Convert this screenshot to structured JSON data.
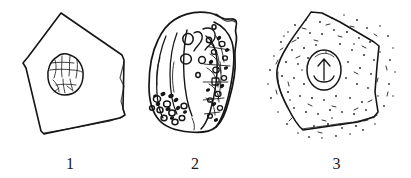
{
  "plate": {
    "background_color": "#ffffff",
    "ink_color": "#151515",
    "title": "",
    "caption": "",
    "figure_count": 3
  },
  "figures": [
    {
      "id": "figure-1",
      "label": "1",
      "subject": "cell",
      "outline_shape": "pentagon",
      "shading": "none",
      "nucleus": {
        "present": true,
        "shape": "oval",
        "position": "upper-center",
        "interior": "chromatin-network"
      },
      "granules": 0,
      "vacuoles": 0
    },
    {
      "id": "figure-2",
      "label": "2",
      "subject": "cell",
      "outline_shape": "irregular-rounded-block",
      "shading": "dense-hatching-right-flank",
      "nucleus": {
        "present": false,
        "shape": "",
        "position": "",
        "interior": ""
      },
      "granules": 18,
      "vacuoles": 6
    },
    {
      "id": "figure-3",
      "label": "3",
      "subject": "cell",
      "outline_shape": "pentagon",
      "shading": "stipple",
      "nucleus": {
        "present": true,
        "shape": "oval",
        "position": "center",
        "interior": "arrow-and-curve"
      },
      "granules": 0,
      "vacuoles": 0
    }
  ]
}
